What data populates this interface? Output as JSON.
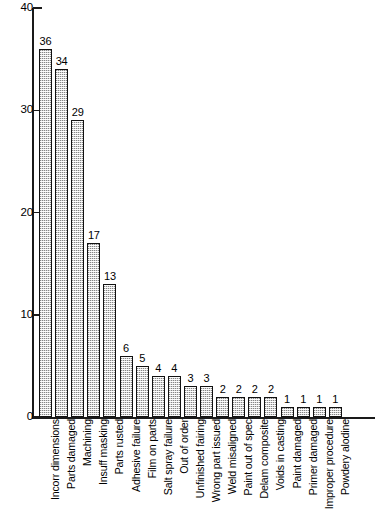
{
  "chart_data": {
    "type": "bar",
    "title": "",
    "subtitle": "",
    "xlabel": "",
    "ylabel": "",
    "ylim": [
      0,
      40
    ],
    "y_ticks": [
      0,
      10,
      20,
      30,
      40
    ],
    "grid": false,
    "legend": null,
    "orientation": "vertical",
    "bar_fill": "#d8d8d8",
    "bar_edge": "#111111",
    "axis_color": "#1a1a1a",
    "background": "#ffffff",
    "value_labels_shown": true,
    "categories": [
      "Incorr dimensions",
      "Parts damaged",
      "Machining",
      "Insuff masking",
      "Parts rusted",
      "Adhesive failure",
      "Film on parts",
      "Salt spray failure",
      "Out of order",
      "Unfinished fairing",
      "Wrong part issued",
      "Weld misaligned",
      "Paint out of spec",
      "Delam composite",
      "Voids in casting",
      "Paint damaged",
      "Primer damaged",
      "Improper procedure",
      "Powdery alodine"
    ],
    "values": [
      36,
      34,
      29,
      17,
      13,
      6,
      5,
      4,
      4,
      3,
      3,
      2,
      2,
      2,
      2,
      1,
      1,
      1,
      1
    ]
  }
}
